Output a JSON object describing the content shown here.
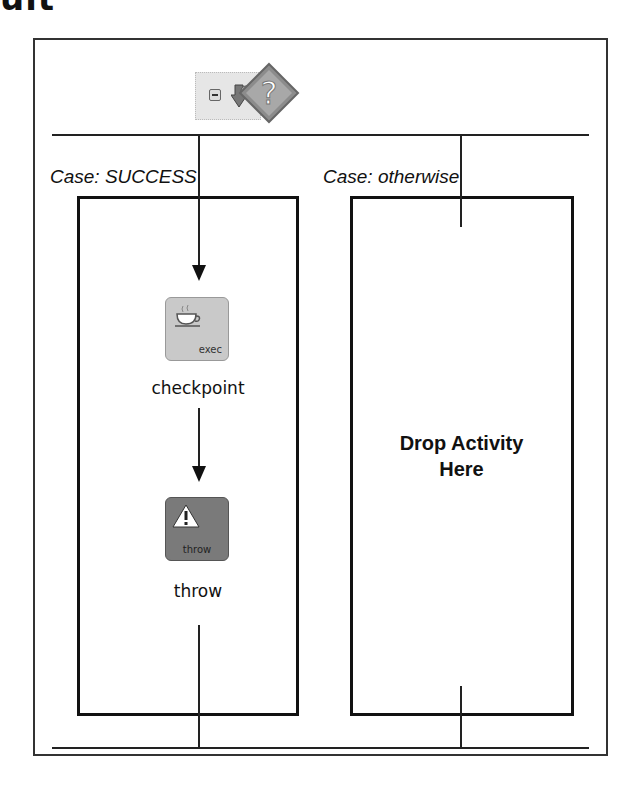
{
  "heading_fragment": "ult",
  "diagram": {
    "type": "switch",
    "toolbar": {
      "collapse_icon": "minus-box-icon",
      "expand_icon": "expand-arrow-icon",
      "switch_icon": "question-diamond-icon"
    },
    "cases": [
      {
        "label": "Case: SUCCESS",
        "activities": [
          {
            "name": "checkpoint",
            "icon_caption": "exec",
            "icon": "coffee-cup-icon"
          },
          {
            "name": "throw",
            "icon_caption": "throw",
            "icon": "warning-triangle-icon"
          }
        ]
      },
      {
        "label": "Case: otherwise",
        "placeholder": "Drop Activity Here",
        "placeholder_lines": [
          "Drop Activity",
          "Here"
        ]
      }
    ]
  }
}
